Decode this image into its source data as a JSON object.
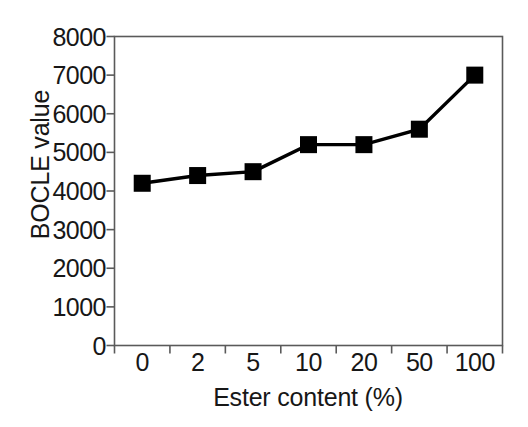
{
  "chart_data": {
    "type": "line",
    "title": "",
    "subtitle": "",
    "xlabel": "Ester content (%)",
    "ylabel": "BOCLE value",
    "categories": [
      "0",
      "2",
      "5",
      "10",
      "20",
      "50",
      "100"
    ],
    "values": [
      4200,
      4400,
      4500,
      5200,
      5200,
      5600,
      7000
    ],
    "series": [
      {
        "name": "BOCLE value",
        "values": [
          4200,
          4400,
          4500,
          5200,
          5200,
          5600,
          7000
        ],
        "marker": "filled-square",
        "color": "#000000",
        "line_color": "#000000"
      }
    ],
    "ylim": [
      0,
      8000
    ],
    "ytick_labels": [
      "0",
      "1000",
      "2000",
      "3000",
      "4000",
      "5000",
      "6000",
      "7000",
      "8000"
    ],
    "ytick_values": [
      0,
      1000,
      2000,
      3000,
      4000,
      5000,
      6000,
      7000,
      8000
    ],
    "xtick_labels": [
      "0",
      "2",
      "5",
      "10",
      "20",
      "50",
      "100"
    ],
    "grid": false,
    "legend": false,
    "legend_position": "none",
    "axis_color": "#555555",
    "background_color": "#ffffff",
    "frame": "box"
  },
  "axis": {
    "y_title": "BOCLE value",
    "x_title": "Ester content (%)"
  }
}
